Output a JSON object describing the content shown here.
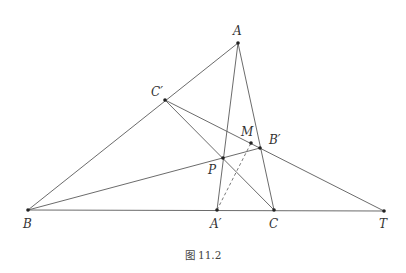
{
  "figure": {
    "caption": "图 11.2",
    "points": {
      "A": {
        "label": "A",
        "x": 238,
        "y": 43
      },
      "Cp": {
        "label": "C′",
        "x": 165,
        "y": 100
      },
      "M": {
        "label": "M",
        "x": 251,
        "y": 143
      },
      "Bp": {
        "label": "B′",
        "x": 260,
        "y": 148
      },
      "P": {
        "label": "P",
        "x": 223,
        "y": 158
      },
      "B": {
        "label": "B",
        "x": 28,
        "y": 210
      },
      "Ap": {
        "label": "A′",
        "x": 217,
        "y": 210
      },
      "C": {
        "label": "C",
        "x": 274,
        "y": 210
      },
      "T": {
        "label": "T",
        "x": 384,
        "y": 211
      }
    },
    "segments": [
      [
        "B",
        "A"
      ],
      [
        "B",
        "T"
      ],
      [
        "A",
        "Ap"
      ],
      [
        "A",
        "C"
      ],
      [
        "Cp",
        "C"
      ],
      [
        "Cp",
        "T"
      ],
      [
        "B",
        "Bp"
      ]
    ],
    "dashed_segments": [
      [
        "Ap",
        "M"
      ]
    ],
    "colors": {
      "line": "#5a5a5a",
      "point": "#222222",
      "text": "#333333"
    }
  }
}
